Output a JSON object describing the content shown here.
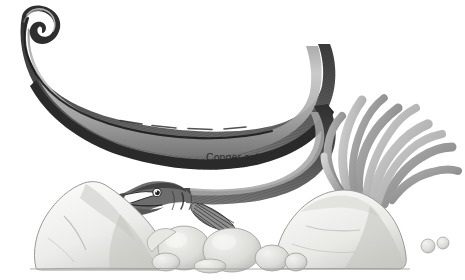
{
  "illustration": {
    "title": "Conger eel",
    "subject": "conger-eel",
    "style": "pencil-and-wash natural history illustration",
    "background_color": "#ffffff"
  },
  "caption": {
    "text": "Conger eel",
    "color": "#2b2b2b",
    "x": 206,
    "y": 151
  },
  "palette": {
    "background": "#ffffff",
    "ink_dark": "#1d1d1d",
    "body_dark": "#3a3a3a",
    "body_mid": "#6e6e6e",
    "body_light": "#b4b4b4",
    "body_pale": "#d8d8d8",
    "rock_fill": "#f1f1ef",
    "rock_shade": "#c9c9c6",
    "rock_outline": "#8d8d8a",
    "pebble_fill": "#e3e3e0",
    "pebble_shade": "#b9b9b5",
    "weed_light": "#c9c9c9",
    "weed_mid": "#9d9d9d",
    "weed_dark": "#7a7a7a",
    "ground_line": "#9a9a97"
  },
  "elements": {
    "eel": {
      "name": "conger-eel-body",
      "description": "long sinuous eel body arching from upper-left tail tip across the top, looping down at right and ending at head on the left above the rocks",
      "features": [
        "tail-tip",
        "dorsal-fin-edge",
        "lateral-line",
        "hatched-body-texture",
        "head",
        "open-mouth",
        "eye",
        "gill-opening",
        "pectoral-fin"
      ]
    },
    "seaweed": {
      "name": "seaweed-fronds",
      "description": "cluster of finger-like grey seaweed fronds rising behind the right rock",
      "frond_count": 9
    },
    "rocks": {
      "name": "rock-group",
      "left_boulder": "large angular pale boulder at lower left",
      "right_boulder": "rounded pale mound at lower right",
      "pebble_cluster": "rounded pebbles of varying size along the bottom centre",
      "small_pebbles": "two tiny pebbles at far right"
    },
    "ground": {
      "name": "ground-line",
      "description": "faint horizontal seabed line under the rocks"
    }
  }
}
